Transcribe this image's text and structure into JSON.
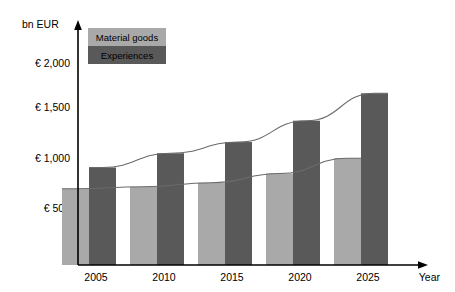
{
  "chart_data": {
    "type": "bar",
    "title": "",
    "subtitle": "",
    "xlabel": "Year",
    "ylabel": "bn EUR",
    "categories": [
      "2005",
      "2010",
      "2015",
      "2020",
      "2025"
    ],
    "series": [
      {
        "name": "Material goods",
        "color": "#a9a9a9",
        "values": [
          750,
          770,
          810,
          900,
          1050
        ]
      },
      {
        "name": "Experiences",
        "color": "#595959",
        "values": [
          960,
          1100,
          1210,
          1420,
          1690
        ]
      }
    ],
    "ylim": [
      0,
      2200
    ],
    "yticks": [
      500,
      1000,
      1500,
      2000
    ],
    "ytick_labels": [
      "€ 500",
      "€ 1,000",
      "€ 1,500",
      "€ 2,000"
    ],
    "grid": false,
    "legend_position": "top-left",
    "trend_lines": true,
    "axis_arrows": true
  },
  "axes": {
    "y_axis_unit_label": "bn EUR",
    "x_axis_label": "Year"
  },
  "legend": {
    "items": [
      {
        "label": "Material goods",
        "color": "#a9a9a9"
      },
      {
        "label": "Experiences",
        "color": "#595959"
      }
    ]
  },
  "colors": {
    "material_goods": "#a9a9a9",
    "experiences": "#595959",
    "axis": "#000000",
    "trend": "#6a6a6a",
    "background": "#ffffff"
  }
}
